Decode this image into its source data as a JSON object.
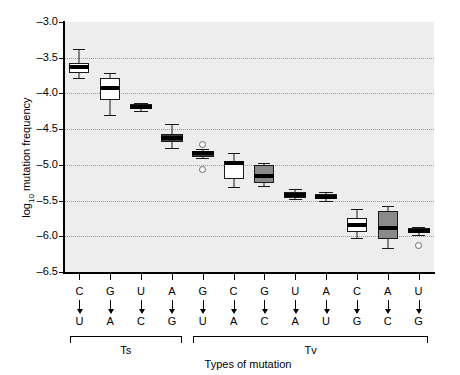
{
  "chart_data": {
    "type": "box",
    "title": "",
    "xlabel": "Types of mutation",
    "ylabel_html": "log10 mutation frequency",
    "ylabel_main": "log",
    "ylabel_sub": "10",
    "ylabel_rest": " mutation frequency",
    "ylim": [
      -6.5,
      -3.0
    ],
    "yticks": [
      -3.0,
      -3.5,
      -4.0,
      -4.5,
      -5.0,
      -5.5,
      -6.0,
      -6.5
    ],
    "ytick_labels": [
      "–3.0",
      "–3.5",
      "–4.0",
      "–4.5",
      "–5.0",
      "–5.5",
      "–6.0",
      "–6.5"
    ],
    "grid": true,
    "grid_axis": "y",
    "legend": "none",
    "plot_bg": "#ededed",
    "categories": [
      "C→U",
      "G→A",
      "U→C",
      "A→G",
      "G→U",
      "C→A",
      "G→C",
      "U→A",
      "A→U",
      "C→G",
      "A→C",
      "U→G"
    ],
    "groups": [
      {
        "label": "Ts",
        "start": 1,
        "end": 4
      },
      {
        "label": "Tv",
        "start": 5,
        "end": 12
      }
    ],
    "boxes": [
      {
        "from": "C",
        "to": "U",
        "whisker_low": -3.78,
        "q1": -3.72,
        "median": -3.63,
        "q3": -3.58,
        "whisker_high": -3.38,
        "fill": "#ffffff",
        "outliers": []
      },
      {
        "from": "G",
        "to": "A",
        "whisker_low": -4.3,
        "q1": -4.09,
        "median": -3.92,
        "q3": -3.78,
        "whisker_high": -3.72,
        "fill": "#ffffff",
        "outliers": []
      },
      {
        "from": "U",
        "to": "C",
        "whisker_low": -4.24,
        "q1": -4.22,
        "median": -4.19,
        "q3": -4.15,
        "whisker_high": -4.13,
        "fill": "#3a3a3a",
        "outliers": []
      },
      {
        "from": "A",
        "to": "G",
        "whisker_low": -4.76,
        "q1": -4.68,
        "median": -4.62,
        "q3": -4.57,
        "whisker_high": -4.43,
        "fill": "#3a3a3a",
        "outliers": []
      },
      {
        "from": "G",
        "to": "U",
        "whisker_low": -4.9,
        "q1": -4.89,
        "median": -4.84,
        "q3": -4.8,
        "whisker_high": -4.78,
        "fill": "#3a3a3a",
        "outliers": [
          -4.71,
          -5.06
        ]
      },
      {
        "from": "C",
        "to": "A",
        "whisker_low": -5.31,
        "q1": -5.2,
        "median": -4.98,
        "q3": -4.94,
        "whisker_high": -4.83,
        "fill": "#ffffff",
        "outliers": []
      },
      {
        "from": "G",
        "to": "C",
        "whisker_low": -5.3,
        "q1": -5.26,
        "median": -5.15,
        "q3": -5.0,
        "whisker_high": -4.98,
        "fill": "#8a8a8a",
        "outliers": []
      },
      {
        "from": "U",
        "to": "A",
        "whisker_low": -5.48,
        "q1": -5.46,
        "median": -5.42,
        "q3": -5.38,
        "whisker_high": -5.34,
        "fill": "#3a3a3a",
        "outliers": []
      },
      {
        "from": "A",
        "to": "U",
        "whisker_low": -5.5,
        "q1": -5.48,
        "median": -5.45,
        "q3": -5.41,
        "whisker_high": -5.38,
        "fill": "#3a3a3a",
        "outliers": []
      },
      {
        "from": "C",
        "to": "G",
        "whisker_low": -6.02,
        "q1": -5.94,
        "median": -5.84,
        "q3": -5.74,
        "whisker_high": -5.62,
        "fill": "#ffffff",
        "outliers": []
      },
      {
        "from": "A",
        "to": "C",
        "whisker_low": -6.16,
        "q1": -6.04,
        "median": -5.88,
        "q3": -5.65,
        "whisker_high": -5.57,
        "fill": "#8a8a8a",
        "outliers": []
      },
      {
        "from": "U",
        "to": "G",
        "whisker_low": -5.98,
        "q1": -5.96,
        "median": -5.92,
        "q3": -5.89,
        "whisker_high": -5.87,
        "fill": "#3a3a3a",
        "outliers": [
          -6.13
        ]
      }
    ]
  }
}
